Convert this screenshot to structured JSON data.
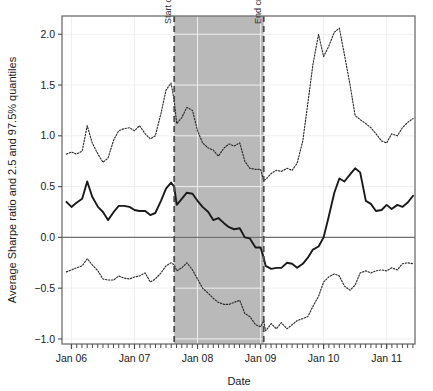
{
  "chart_data": {
    "type": "line",
    "title": "",
    "xlabel": "Date",
    "ylabel": "Average Sharpe ratio and 2.5 and 97.5% quantiles",
    "xlim": [
      2005.85,
      2011.45
    ],
    "ylim": [
      -1.05,
      2.18
    ],
    "yticks": [
      -1.0,
      -0.5,
      0.0,
      0.5,
      1.0,
      1.5,
      2.0
    ],
    "ytick_labels": [
      "-1.0",
      "-0.5",
      "0.0",
      "0.5",
      "1.0",
      "1.5",
      "2.0"
    ],
    "xticks": [
      2006,
      2007,
      2008,
      2009,
      2010,
      2011
    ],
    "xtick_labels": [
      "Jan 06",
      "Jan 07",
      "Jan 08",
      "Jan 09",
      "Jan 10",
      "Jan 11"
    ],
    "grid": true,
    "legend_position": "none",
    "zero_line": 0.0,
    "shaded_region": {
      "label": "crisis period",
      "x_start": 2007.63,
      "x_end": 2009.05,
      "color": "#b9b9b9"
    },
    "annotations": [
      {
        "text": "Start crisis",
        "x": 2007.63,
        "rotation": -90,
        "style": "dashed-vline",
        "color": "#4d4d4d"
      },
      {
        "text": "End crisis",
        "x": 2009.05,
        "rotation": -90,
        "style": "dashed-vline",
        "color": "#4d4d4d"
      }
    ],
    "x": [
      2005.92,
      2006.0,
      2006.08,
      2006.17,
      2006.25,
      2006.33,
      2006.42,
      2006.5,
      2006.58,
      2006.67,
      2006.75,
      2006.83,
      2006.92,
      2007.0,
      2007.08,
      2007.17,
      2007.25,
      2007.33,
      2007.42,
      2007.5,
      2007.58,
      2007.63,
      2007.67,
      2007.75,
      2007.83,
      2007.92,
      2008.0,
      2008.08,
      2008.17,
      2008.25,
      2008.33,
      2008.42,
      2008.5,
      2008.58,
      2008.67,
      2008.75,
      2008.83,
      2008.92,
      2009.0,
      2009.05,
      2009.08,
      2009.17,
      2009.25,
      2009.33,
      2009.42,
      2009.5,
      2009.58,
      2009.67,
      2009.75,
      2009.83,
      2009.92,
      2010.0,
      2010.08,
      2010.17,
      2010.25,
      2010.33,
      2010.42,
      2010.5,
      2010.58,
      2010.67,
      2010.75,
      2010.83,
      2010.92,
      2011.0,
      2011.08,
      2011.17,
      2011.25,
      2011.33,
      2011.42
    ],
    "series": [
      {
        "name": "97.5% quantile",
        "style": "dotted",
        "color": "#2b2b2b",
        "values": [
          0.82,
          0.84,
          0.82,
          0.85,
          1.1,
          0.93,
          0.82,
          0.74,
          0.78,
          0.96,
          1.05,
          1.07,
          1.08,
          1.05,
          1.1,
          1.02,
          0.97,
          1.0,
          1.22,
          1.45,
          1.52,
          1.35,
          1.12,
          1.18,
          1.28,
          1.25,
          1.05,
          0.93,
          0.88,
          0.86,
          0.8,
          0.88,
          0.92,
          0.9,
          0.93,
          0.75,
          0.68,
          0.67,
          0.67,
          0.56,
          0.57,
          0.63,
          0.66,
          0.65,
          0.68,
          0.66,
          0.73,
          0.95,
          1.32,
          1.7,
          2.0,
          1.78,
          1.88,
          2.02,
          2.06,
          1.8,
          1.5,
          1.2,
          1.16,
          1.12,
          1.08,
          1.02,
          0.95,
          0.93,
          1.02,
          1.0,
          1.08,
          1.13,
          1.17
        ]
      },
      {
        "name": "Average Sharpe ratio",
        "style": "solid",
        "color": "#1a1a1a",
        "values": [
          0.35,
          0.3,
          0.34,
          0.38,
          0.55,
          0.4,
          0.3,
          0.25,
          0.17,
          0.25,
          0.31,
          0.31,
          0.3,
          0.27,
          0.26,
          0.26,
          0.22,
          0.24,
          0.36,
          0.48,
          0.54,
          0.5,
          0.32,
          0.38,
          0.44,
          0.43,
          0.36,
          0.3,
          0.25,
          0.17,
          0.19,
          0.14,
          0.1,
          0.08,
          0.09,
          0.0,
          -0.01,
          -0.1,
          -0.1,
          -0.2,
          -0.28,
          -0.31,
          -0.3,
          -0.3,
          -0.25,
          -0.26,
          -0.3,
          -0.26,
          -0.2,
          -0.12,
          -0.09,
          0.0,
          0.2,
          0.44,
          0.58,
          0.55,
          0.62,
          0.68,
          0.64,
          0.36,
          0.33,
          0.26,
          0.27,
          0.32,
          0.28,
          0.32,
          0.3,
          0.34,
          0.41
        ]
      },
      {
        "name": "2.5% quantile",
        "style": "dotted",
        "color": "#2b2b2b",
        "values": [
          -0.34,
          -0.32,
          -0.3,
          -0.28,
          -0.21,
          -0.27,
          -0.33,
          -0.41,
          -0.42,
          -0.42,
          -0.38,
          -0.4,
          -0.41,
          -0.39,
          -0.38,
          -0.35,
          -0.44,
          -0.41,
          -0.35,
          -0.28,
          -0.25,
          -0.27,
          -0.33,
          -0.3,
          -0.25,
          -0.32,
          -0.41,
          -0.5,
          -0.55,
          -0.6,
          -0.64,
          -0.66,
          -0.66,
          -0.64,
          -0.62,
          -0.75,
          -0.78,
          -0.86,
          -0.88,
          -0.82,
          -0.92,
          -0.85,
          -0.9,
          -0.84,
          -0.9,
          -0.86,
          -0.82,
          -0.8,
          -0.78,
          -0.68,
          -0.58,
          -0.44,
          -0.39,
          -0.36,
          -0.38,
          -0.48,
          -0.52,
          -0.47,
          -0.35,
          -0.33,
          -0.35,
          -0.33,
          -0.32,
          -0.33,
          -0.3,
          -0.32,
          -0.26,
          -0.25,
          -0.26
        ]
      }
    ]
  }
}
